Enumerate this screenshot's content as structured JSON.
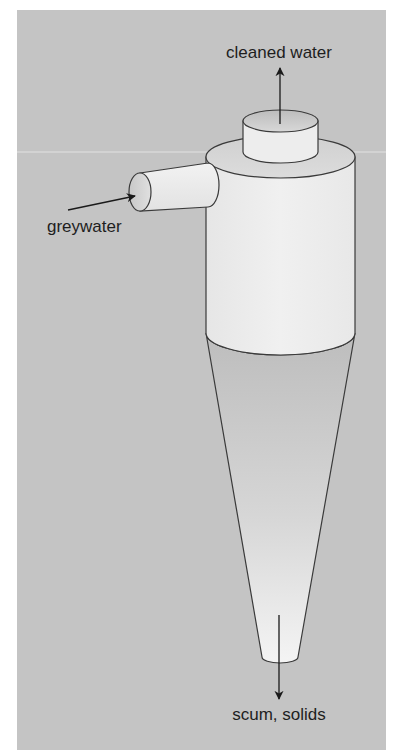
{
  "diagram": {
    "labels": {
      "outlet_top": "cleaned water",
      "inlet": "greywater",
      "outlet_bottom": "scum, solids"
    },
    "colors": {
      "page_background": "#ffffff",
      "panel_background": "#c4c4c4",
      "body_fill": "#ececec",
      "cone_top": "#c0c0c0",
      "cone_bottom": "#f2f2f2",
      "outline": "#3a3a3a",
      "arrow": "#1a1a1a"
    },
    "components": [
      {
        "id": "overflow-pipe",
        "description": "short vertical outlet cylinder on top"
      },
      {
        "id": "main-cylinder",
        "description": "cylindrical upper chamber"
      },
      {
        "id": "inlet-pipe",
        "description": "tangential horizontal inlet pipe"
      },
      {
        "id": "cone",
        "description": "conical lower chamber"
      }
    ],
    "flows": [
      {
        "from": "overflow-pipe",
        "direction": "up",
        "label_ref": "outlet_top"
      },
      {
        "from": "outside",
        "to": "inlet-pipe",
        "direction": "right",
        "label_ref": "inlet"
      },
      {
        "from": "cone",
        "direction": "down",
        "label_ref": "outlet_bottom"
      }
    ]
  }
}
